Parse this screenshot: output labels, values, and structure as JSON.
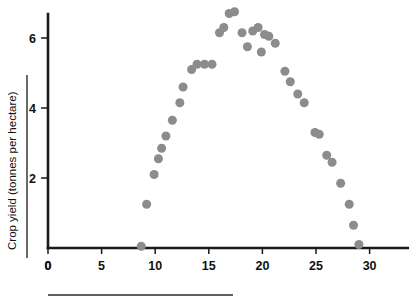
{
  "chart_data": {
    "type": "scatter",
    "title": "",
    "xlabel": "",
    "ylabel": "Crop yield (tonnes per hectare)",
    "xlim": [
      0,
      33.5
    ],
    "ylim": [
      0,
      6.95
    ],
    "grid": false,
    "legend": null,
    "marker": {
      "shape": "circle",
      "color": "#8c8c8c",
      "size_px": 9
    },
    "xticks": [
      0,
      5,
      10,
      15,
      20,
      25,
      30
    ],
    "xticklabels": [
      "0",
      "5",
      "10",
      "15",
      "20",
      "25",
      "30"
    ],
    "yticks": [
      0,
      2,
      4,
      6
    ],
    "yticklabels": [
      "0",
      "2",
      "4",
      "6"
    ],
    "points": [
      {
        "x": 8.7,
        "y": 0.05
      },
      {
        "x": 9.2,
        "y": 1.25
      },
      {
        "x": 9.9,
        "y": 2.1
      },
      {
        "x": 10.3,
        "y": 2.55
      },
      {
        "x": 10.6,
        "y": 2.85
      },
      {
        "x": 11.0,
        "y": 3.2
      },
      {
        "x": 11.6,
        "y": 3.65
      },
      {
        "x": 12.3,
        "y": 4.15
      },
      {
        "x": 12.6,
        "y": 4.6
      },
      {
        "x": 13.4,
        "y": 5.1
      },
      {
        "x": 13.9,
        "y": 5.25
      },
      {
        "x": 14.6,
        "y": 5.25
      },
      {
        "x": 15.3,
        "y": 5.25
      },
      {
        "x": 16.0,
        "y": 6.15
      },
      {
        "x": 16.4,
        "y": 6.3
      },
      {
        "x": 16.9,
        "y": 6.7
      },
      {
        "x": 17.4,
        "y": 6.75
      },
      {
        "x": 18.1,
        "y": 6.15
      },
      {
        "x": 18.6,
        "y": 5.75
      },
      {
        "x": 19.1,
        "y": 6.2
      },
      {
        "x": 19.6,
        "y": 6.3
      },
      {
        "x": 19.9,
        "y": 5.6
      },
      {
        "x": 20.2,
        "y": 6.1
      },
      {
        "x": 20.6,
        "y": 6.05
      },
      {
        "x": 21.2,
        "y": 5.85
      },
      {
        "x": 22.1,
        "y": 5.05
      },
      {
        "x": 22.6,
        "y": 4.75
      },
      {
        "x": 23.3,
        "y": 4.4
      },
      {
        "x": 23.9,
        "y": 4.15
      },
      {
        "x": 24.9,
        "y": 3.3
      },
      {
        "x": 25.3,
        "y": 3.25
      },
      {
        "x": 26.0,
        "y": 2.65
      },
      {
        "x": 26.5,
        "y": 2.45
      },
      {
        "x": 27.3,
        "y": 1.85
      },
      {
        "x": 28.1,
        "y": 1.25
      },
      {
        "x": 28.5,
        "y": 0.65
      },
      {
        "x": 29.0,
        "y": 0.1
      }
    ]
  },
  "axes": {
    "y_axis_title": "Crop yield (tonnes per hectare)"
  }
}
